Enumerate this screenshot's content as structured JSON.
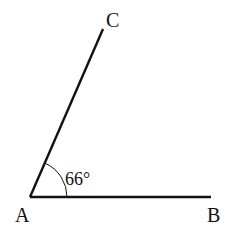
{
  "diagram": {
    "type": "angle",
    "vertex": {
      "name": "A",
      "label": "A"
    },
    "ray_endpoints": [
      {
        "name": "B",
        "label": "B"
      },
      {
        "name": "C",
        "label": "C"
      }
    ],
    "angle": {
      "between": [
        "AB",
        "AC"
      ],
      "label": "66°",
      "value_degrees": 66
    },
    "line_color": "#111111"
  }
}
